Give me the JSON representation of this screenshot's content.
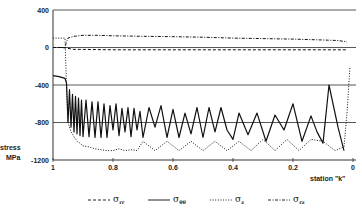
{
  "chart_data": {
    "type": "line",
    "title": "",
    "xlabel": "station \"k\"",
    "ylabel": "stress MPa",
    "xlim": [
      1,
      0
    ],
    "ylim": [
      -1200,
      400
    ],
    "x_ticks": [
      "1",
      "0.8",
      "0.6",
      "0.4",
      "0.2",
      "0"
    ],
    "y_ticks": [
      "400",
      "0",
      "-400",
      "-800",
      "-1200"
    ],
    "grid": "horizontal",
    "legend_position": "bottom",
    "series": [
      {
        "name": "σrr",
        "style": "dashed",
        "x": [
          1,
          0.97,
          0.95,
          0.93,
          0.9,
          0.8,
          0.6,
          0.4,
          0.2,
          0.02
        ],
        "values": [
          0,
          0,
          -10,
          -20,
          -20,
          -25,
          -25,
          -25,
          -25,
          -25
        ]
      },
      {
        "name": "σθθ",
        "style": "solid",
        "x": [
          1,
          0.98,
          0.96,
          0.955,
          0.95,
          0.945,
          0.94,
          0.935,
          0.93,
          0.925,
          0.92,
          0.915,
          0.91,
          0.905,
          0.9,
          0.89,
          0.88,
          0.87,
          0.86,
          0.85,
          0.84,
          0.83,
          0.82,
          0.81,
          0.8,
          0.79,
          0.78,
          0.77,
          0.76,
          0.75,
          0.74,
          0.73,
          0.72,
          0.71,
          0.7,
          0.68,
          0.66,
          0.64,
          0.62,
          0.6,
          0.58,
          0.56,
          0.54,
          0.52,
          0.5,
          0.48,
          0.46,
          0.44,
          0.42,
          0.4,
          0.38,
          0.35,
          0.32,
          0.29,
          0.26,
          0.23,
          0.2,
          0.17,
          0.14,
          0.12,
          0.1,
          0.08,
          0.05,
          0.03
        ],
        "values": [
          -300,
          -310,
          -330,
          -380,
          -800,
          -450,
          -850,
          -500,
          -900,
          -520,
          -920,
          -540,
          -940,
          -560,
          -950,
          -560,
          -950,
          -580,
          -960,
          -580,
          -960,
          -600,
          -960,
          -620,
          -880,
          -600,
          -940,
          -650,
          -900,
          -640,
          -950,
          -650,
          -880,
          -680,
          -960,
          -640,
          -850,
          -620,
          -960,
          -660,
          -960,
          -700,
          -920,
          -640,
          -960,
          -640,
          -900,
          -640,
          -880,
          -980,
          -700,
          -930,
          -700,
          -1000,
          -720,
          -880,
          -600,
          -1000,
          -730,
          -900,
          -1020,
          -400,
          -850,
          -1100
        ]
      },
      {
        "name": "σz",
        "style": "dotted",
        "x": [
          1,
          0.96,
          0.955,
          0.95,
          0.94,
          0.93,
          0.92,
          0.91,
          0.9,
          0.88,
          0.86,
          0.84,
          0.82,
          0.8,
          0.78,
          0.76,
          0.74,
          0.72,
          0.7,
          0.66,
          0.62,
          0.58,
          0.54,
          0.5,
          0.46,
          0.42,
          0.38,
          0.34,
          0.3,
          0.26,
          0.22,
          0.18,
          0.14,
          0.1,
          0.06,
          0.03,
          0.02,
          0.01
        ],
        "values": [
          100,
          100,
          -400,
          -800,
          -900,
          -950,
          -1000,
          -1020,
          -1050,
          -1060,
          -1080,
          -1090,
          -1100,
          -1100,
          -1080,
          -1100,
          -1090,
          -1100,
          -1000,
          -1100,
          -1000,
          -1100,
          -1000,
          -1100,
          -1000,
          -1100,
          -1000,
          -1100,
          -980,
          -1100,
          -980,
          -1100,
          -980,
          -1000,
          -1100,
          -1060,
          -700,
          -200
        ]
      },
      {
        "name": "σrz",
        "style": "dash-dot",
        "x": [
          1,
          0.96,
          0.955,
          0.95,
          0.93,
          0.9,
          0.85,
          0.8,
          0.7,
          0.6,
          0.5,
          0.4,
          0.3,
          0.2,
          0.1,
          0.05,
          0.02
        ],
        "values": [
          0,
          0,
          60,
          100,
          120,
          130,
          130,
          125,
          120,
          115,
          110,
          100,
          95,
          90,
          80,
          75,
          60
        ]
      }
    ]
  },
  "axes": {
    "y_label_line1": "stress",
    "y_label_line2": "MPa",
    "x_label": "station \"k\""
  },
  "legend": [
    {
      "symbol": "σ",
      "sub": "rr",
      "style": "dashed"
    },
    {
      "symbol": "σ",
      "sub": "θθ",
      "style": "solid"
    },
    {
      "symbol": "σ",
      "sub": "z",
      "style": "dotted"
    },
    {
      "symbol": "σ",
      "sub": "rz",
      "style": "dash-dot"
    }
  ]
}
